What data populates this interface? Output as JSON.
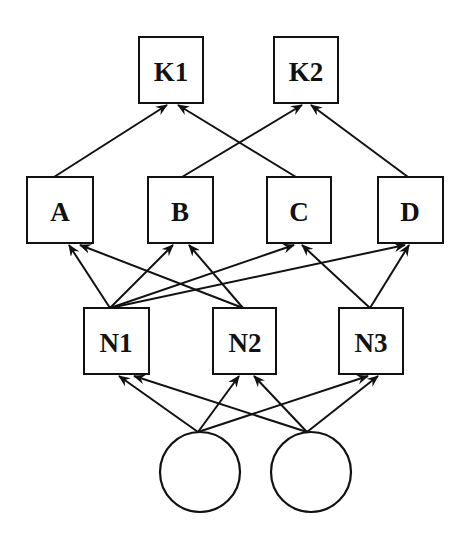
{
  "diagram": {
    "type": "layered-network",
    "nodes": [
      {
        "id": "K1",
        "label": "K1",
        "shape": "box",
        "layer": 0
      },
      {
        "id": "K2",
        "label": "K2",
        "shape": "box",
        "layer": 0
      },
      {
        "id": "A",
        "label": "A",
        "shape": "box",
        "layer": 1
      },
      {
        "id": "B",
        "label": "B",
        "shape": "box",
        "layer": 1
      },
      {
        "id": "C",
        "label": "C",
        "shape": "box",
        "layer": 1
      },
      {
        "id": "D",
        "label": "D",
        "shape": "box",
        "layer": 1
      },
      {
        "id": "N1",
        "label": "N1",
        "shape": "box",
        "layer": 2
      },
      {
        "id": "N2",
        "label": "N2",
        "shape": "box",
        "layer": 2
      },
      {
        "id": "N3",
        "label": "N3",
        "shape": "box",
        "layer": 2
      },
      {
        "id": "I1",
        "label": "",
        "shape": "circle",
        "layer": 3
      },
      {
        "id": "I2",
        "label": "",
        "shape": "circle",
        "layer": 3
      }
    ],
    "edges": [
      {
        "from": "A",
        "to": "K1"
      },
      {
        "from": "C",
        "to": "K1"
      },
      {
        "from": "B",
        "to": "K2"
      },
      {
        "from": "D",
        "to": "K2"
      },
      {
        "from": "N1",
        "to": "A"
      },
      {
        "from": "N1",
        "to": "B"
      },
      {
        "from": "N1",
        "to": "C"
      },
      {
        "from": "N1",
        "to": "D"
      },
      {
        "from": "N2",
        "to": "A"
      },
      {
        "from": "N2",
        "to": "B"
      },
      {
        "from": "N3",
        "to": "C"
      },
      {
        "from": "N3",
        "to": "D"
      },
      {
        "from": "I1",
        "to": "N1"
      },
      {
        "from": "I1",
        "to": "N2"
      },
      {
        "from": "I1",
        "to": "N3"
      },
      {
        "from": "I2",
        "to": "N1"
      },
      {
        "from": "I2",
        "to": "N2"
      },
      {
        "from": "I2",
        "to": "N3"
      }
    ],
    "labels": {
      "K1": "K1",
      "K2": "K2",
      "A": "A",
      "B": "B",
      "C": "C",
      "D": "D",
      "N1": "N1",
      "N2": "N2",
      "N3": "N3"
    },
    "colors": {
      "stroke": "#111111",
      "background": "#ffffff"
    }
  }
}
